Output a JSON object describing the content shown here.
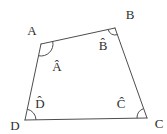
{
  "figure": {
    "background_color": "#ffffff",
    "line_color": "#4d4d4d",
    "text_color": "#2e2e2e",
    "canvas_width": 167,
    "canvas_height": 134,
    "vertices": [
      {
        "id": "A",
        "x": 41,
        "y": 44,
        "vertex_label": "A",
        "vertex_label_x": 32,
        "vertex_label_y": 35,
        "angle_label": "Â",
        "angle_label_x": 57,
        "angle_label_y": 71,
        "arc_radius": 12
      },
      {
        "id": "B",
        "x": 115,
        "y": 28,
        "vertex_label": "B",
        "vertex_label_x": 130,
        "vertex_label_y": 19,
        "angle_label": "B̂",
        "angle_label_x": 103,
        "angle_label_y": 50,
        "arc_radius": 7
      },
      {
        "id": "C",
        "x": 147,
        "y": 118,
        "vertex_label": "C",
        "vertex_label_x": 159,
        "vertex_label_y": 128,
        "angle_label": "Ĉ",
        "angle_label_x": 121,
        "angle_label_y": 108,
        "arc_radius": 10
      },
      {
        "id": "D",
        "x": 25,
        "y": 120,
        "vertex_label": "D",
        "vertex_label_x": 15,
        "vertex_label_y": 130,
        "angle_label": "D̂",
        "angle_label_x": 40,
        "angle_label_y": 108,
        "arc_radius": 11
      }
    ],
    "edges": [
      [
        "A",
        "B"
      ],
      [
        "B",
        "C"
      ],
      [
        "C",
        "D"
      ],
      [
        "D",
        "A"
      ]
    ],
    "stroke_width": 1
  }
}
